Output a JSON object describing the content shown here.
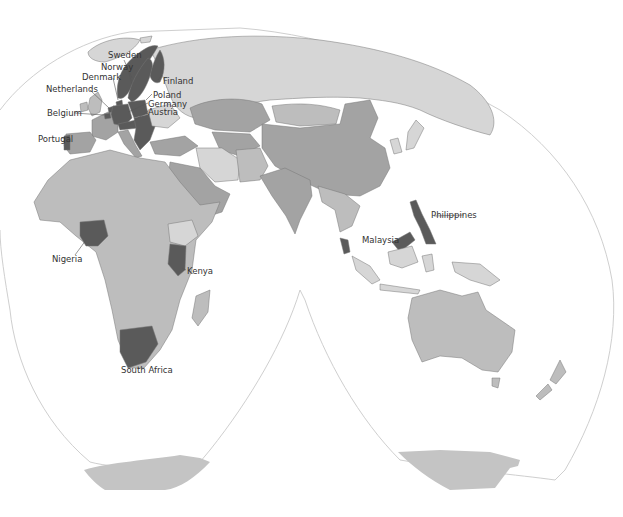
{
  "map": {
    "projection": "interrupted-homolosine",
    "colors": {
      "background": "#ffffff",
      "highlight": "#5a5a5a",
      "medium": "#a3a3a3",
      "light": "#bdbdbd",
      "lighter": "#d6d6d6",
      "border": "#777777",
      "outline": "#cfcfcf",
      "label": "#333333"
    },
    "labels": [
      {
        "id": "sweden",
        "text": "Sweden"
      },
      {
        "id": "norway",
        "text": "Norway"
      },
      {
        "id": "denmark",
        "text": "Denmark"
      },
      {
        "id": "finland",
        "text": "Finland"
      },
      {
        "id": "netherlands",
        "text": "Netherlands"
      },
      {
        "id": "poland",
        "text": "Poland"
      },
      {
        "id": "germany",
        "text": "Germany"
      },
      {
        "id": "austria",
        "text": "Austria"
      },
      {
        "id": "belgium",
        "text": "Belgium"
      },
      {
        "id": "portugal",
        "text": "Portugal"
      },
      {
        "id": "philippines",
        "text": "Philippines"
      },
      {
        "id": "malaysia",
        "text": "Malaysia"
      },
      {
        "id": "nigeria",
        "text": "Nigeria"
      },
      {
        "id": "kenya",
        "text": "Kenya"
      },
      {
        "id": "south_africa",
        "text": "South Africa"
      }
    ],
    "highlighted_countries": [
      "Sweden",
      "Norway",
      "Denmark",
      "Finland",
      "Netherlands",
      "Poland",
      "Germany",
      "Austria",
      "Belgium",
      "Portugal",
      "Philippines",
      "Malaysia",
      "Nigeria",
      "Kenya",
      "South Africa"
    ]
  }
}
